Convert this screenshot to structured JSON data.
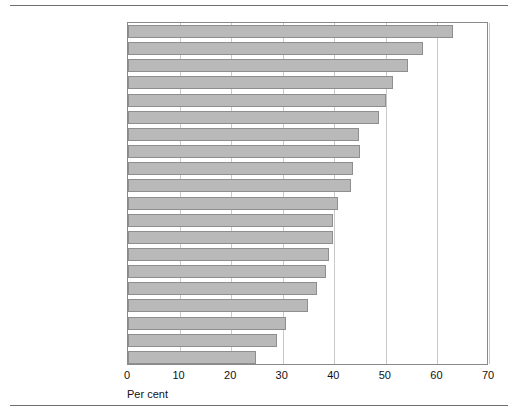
{
  "chart_data": {
    "type": "bar",
    "orientation": "horizontal",
    "title": "",
    "subtitle": "",
    "xlabel": "Per cent",
    "ylabel": "",
    "xlim": [
      0,
      70
    ],
    "ylim": null,
    "grid": "vertical-gridlines-at-major-ticks",
    "legend": "none",
    "xticks": [
      0,
      10,
      20,
      30,
      40,
      50,
      60,
      70
    ],
    "xtick_labels": [
      "0",
      "10",
      "20",
      "30",
      "40",
      "50",
      "60",
      "70"
    ],
    "categories": [
      "Portugal",
      "Canada",
      "Chile",
      "Slovenia",
      "United States",
      "Australia",
      "Finland",
      "Ireland",
      "Belgium (Flanders)",
      "United Kingdom",
      "Switzerland",
      "Denmark",
      "Netherlands",
      "Norway",
      "New Zealand",
      "Poland",
      "Hungary",
      "Sweden",
      "Czech Republic",
      "Germany"
    ],
    "values": [
      63.0,
      57.2,
      54.3,
      51.4,
      50.0,
      48.7,
      44.8,
      45.0,
      43.6,
      43.2,
      40.7,
      39.7,
      39.8,
      39.0,
      38.4,
      36.7,
      34.9,
      30.6,
      28.9,
      24.8
    ],
    "bar_color": "#b9b9b9",
    "bar_edge_color": "#8e8e8e",
    "gridline_color": "#c9c9c9",
    "axis_color": "#8a8a8a"
  },
  "axis": {
    "x_title": "Per cent"
  }
}
